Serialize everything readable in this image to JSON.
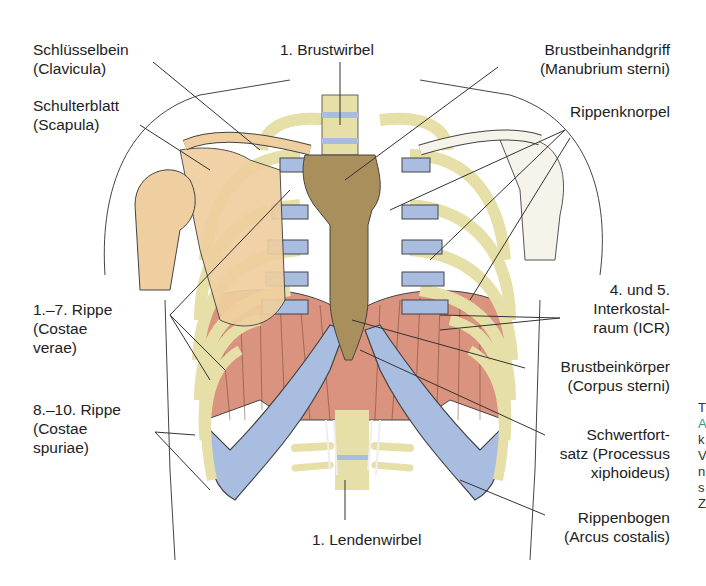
{
  "figure": {
    "type": "anatomical-diagram"
  },
  "labels": {
    "clavicula": {
      "line1": "Schlüsselbein",
      "line2": "(Clavicula)"
    },
    "scapula": {
      "line1": "Schulterblatt",
      "line2": "(Scapula)"
    },
    "brustwirbel": {
      "line1": "1. Brustwirbel"
    },
    "manubrium": {
      "line1": "Brustbeinhandgriff",
      "line2": "(Manubrium sterni)"
    },
    "rippenknorpel": {
      "line1": "Rippenknorpel"
    },
    "costae_verae": {
      "line1": "1.–7. Rippe",
      "line2": "(Costae",
      "line3": "verae)"
    },
    "icr": {
      "line1": "4. und 5.",
      "line2": "Interkostal-",
      "line3": "raum (ICR)"
    },
    "corpus_sterni": {
      "line1": "Brustbeinkörper",
      "line2": "(Corpus sterni)"
    },
    "costae_spuriae": {
      "line1": "8.–10. Rippe",
      "line2": "(Costae",
      "line3": "spuriae)"
    },
    "xiphoideus": {
      "line1": "Schwertfort-",
      "line2": "satz (Processus",
      "line3": "xiphoideus)"
    },
    "arcus_costalis": {
      "line1": "Rippenbogen",
      "line2": "(Arcus costalis)"
    },
    "lendenwirbel": {
      "line1": "1. Lendenwirbel"
    }
  },
  "clipped_margin_text": [
    "T",
    "A",
    "k",
    "V",
    "n",
    "s",
    "Z"
  ],
  "colors": {
    "bone": "#e6e0a8",
    "sternum": "#a88f5c",
    "cartilage": "#a9bde0",
    "scapula": "#efcf9f",
    "muscle": "#d9937e",
    "outline": "#3a3a3a"
  }
}
